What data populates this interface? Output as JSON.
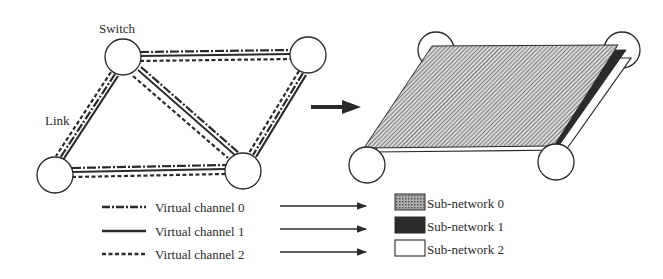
{
  "labels": {
    "switch": "Switch",
    "link": "Link"
  },
  "legend": {
    "channels": [
      {
        "label": "Virtual channel 0",
        "style": "dash-dot"
      },
      {
        "label": "Virtual channel 1",
        "style": "solid"
      },
      {
        "label": "Virtual channel 2",
        "style": "dashed"
      }
    ],
    "subnetworks": [
      {
        "label": "Sub-network 0",
        "fill": "hatched-gray"
      },
      {
        "label": "Sub-network 1",
        "fill": "#2b2b2b"
      },
      {
        "label": "Sub-network 2",
        "fill": "#ffffff"
      }
    ]
  },
  "colors": {
    "ink": "#2a2a2a",
    "hatch": "#8a8a8a",
    "dark_layer": "#2b2b2b",
    "background": "#ffffff"
  }
}
